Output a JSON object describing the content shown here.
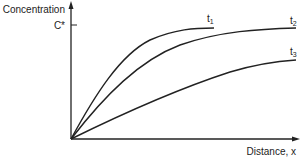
{
  "diagram": {
    "y_axis": {
      "label": "Concentration",
      "tick_label": "C*"
    },
    "x_axis": {
      "label": "Distance, x"
    },
    "curves": [
      {
        "id": "t1",
        "label": "t",
        "subscript": "1"
      },
      {
        "id": "t2",
        "label": "t",
        "subscript": "2"
      },
      {
        "id": "t3",
        "label": "t",
        "subscript": "3"
      }
    ],
    "colors": {
      "line": "#222222",
      "background": "#ffffff"
    }
  }
}
